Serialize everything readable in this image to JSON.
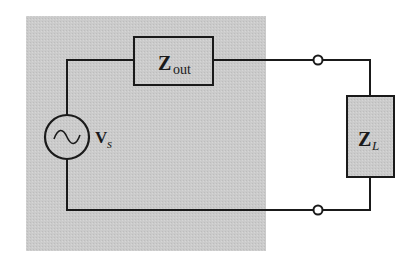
{
  "diagram": {
    "type": "circuit",
    "colors": {
      "source_block": "#c8c8c8",
      "wire": "#1a1a1a",
      "component_fill": "#c8c8c8",
      "background": "#ffffff"
    },
    "components": {
      "source": {
        "symbol": "ac-voltage-source",
        "label_main": "V",
        "label_sub": "s"
      },
      "output_impedance": {
        "symbol": "impedance-box",
        "label_main": "Z",
        "label_sub": "out"
      },
      "load_impedance": {
        "symbol": "impedance-box",
        "label_main": "Z",
        "label_sub": "L"
      },
      "terminals": [
        {
          "name": "top-terminal"
        },
        {
          "name": "bottom-terminal"
        }
      ]
    }
  }
}
